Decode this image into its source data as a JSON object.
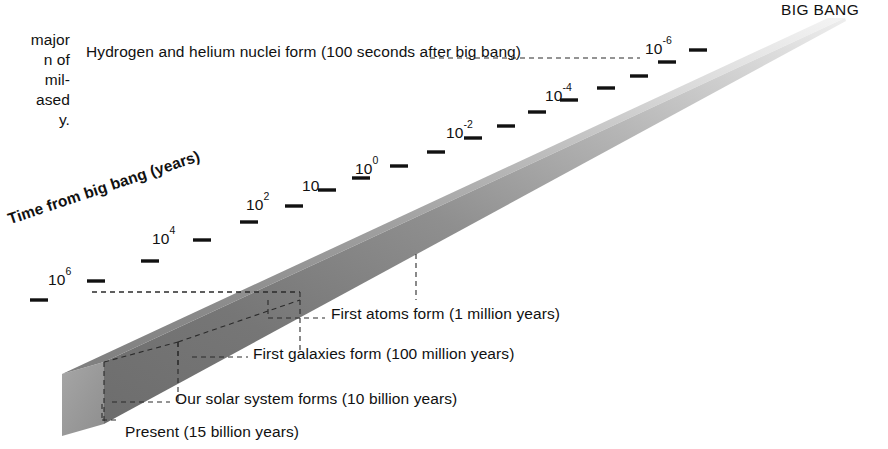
{
  "figure": {
    "big_bang_label": "BIG BANG",
    "axis_title": "Time from big bang (years)",
    "colors": {
      "beam_top_near": "#8c8c8c",
      "beam_top_far": "#f0f0f0",
      "beam_side_near": "#6e6e6e",
      "beam_side_far": "#d8d8d8",
      "beam_end_cap": "#9a9a9a",
      "text": "#111111",
      "leader_line": "#222222",
      "background": "#ffffff"
    }
  },
  "caption": {
    "lines": [
      "major",
      "n of",
      "mil-",
      "ased",
      "y."
    ]
  },
  "events": {
    "nuclei": "Hydrogen and helium nuclei form (100 seconds after big bang)",
    "atoms": "First atoms form (1 million years)",
    "galaxies": "First galaxies form (100 million years)",
    "solar": "Our solar system forms (10 billion years)",
    "present": "Present (15 billion years)"
  },
  "chart_data": {
    "type": "line",
    "title": "Time from big bang (years)",
    "xlabel": "Time from big bang (years)",
    "ylabel": "",
    "scale": "logarithmic",
    "direction": "present (bottom-left) to big bang (top-right)",
    "grid": false,
    "legend": null,
    "axis_tick_labels": [
      {
        "id": "p6",
        "base": "10",
        "exponent": "6",
        "text": "10⁶",
        "x": 48,
        "y": 272
      },
      {
        "id": "p4",
        "base": "10",
        "exponent": "4",
        "text": "10⁴",
        "x": 152,
        "y": 231
      },
      {
        "id": "p2",
        "base": "10",
        "exponent": "2",
        "text": "10²",
        "x": 246,
        "y": 197
      },
      {
        "id": "p1",
        "base": "10",
        "exponent": "",
        "text": "10",
        "x": 302,
        "y": 178
      },
      {
        "id": "p0",
        "base": "10",
        "exponent": "0",
        "text": "10⁰",
        "x": 355,
        "y": 161
      },
      {
        "id": "pm2",
        "base": "10",
        "exponent": "-2",
        "text": "10⁻²",
        "x": 446,
        "y": 125
      },
      {
        "id": "pm4",
        "base": "10",
        "exponent": "-4",
        "text": "10⁻⁴",
        "x": 545,
        "y": 88
      },
      {
        "id": "pm6",
        "base": "10",
        "exponent": "-6",
        "text": "10⁻⁶",
        "x": 645,
        "y": 41
      }
    ],
    "annotations": [
      {
        "label": "Hydrogen and helium nuclei form (100 seconds after big bang)",
        "value": "100 seconds",
        "tick": "10⁻⁶ region"
      },
      {
        "label": "First atoms form (1 million years)",
        "value": "1 million years",
        "tick": "10⁶"
      },
      {
        "label": "First galaxies form (100 million years)",
        "value": "100 million years"
      },
      {
        "label": "Our solar system forms (10 billion years)",
        "value": "10 billion years"
      },
      {
        "label": "Present (15 billion years)",
        "value": "15 billion years"
      }
    ],
    "endpoints": {
      "start": "Present (15 billion years)",
      "end": "BIG BANG"
    }
  }
}
